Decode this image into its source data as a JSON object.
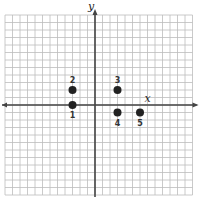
{
  "diagram": {
    "type": "coordinate-plane",
    "axes": {
      "x_label": "x",
      "y_label": "y"
    },
    "grid": {
      "x_min": -12,
      "x_max": 13,
      "y_min": -12,
      "y_max": 12,
      "cell_px": 7.5
    },
    "points": [
      {
        "label": "1",
        "x": -3,
        "y": 0,
        "label_pos": "below"
      },
      {
        "label": "2",
        "x": -3,
        "y": 2,
        "label_pos": "above"
      },
      {
        "label": "3",
        "x": 3,
        "y": 2,
        "label_pos": "above"
      },
      {
        "label": "4",
        "x": 3,
        "y": -1,
        "label_pos": "below"
      },
      {
        "label": "5",
        "x": 6,
        "y": -1,
        "label_pos": "below"
      }
    ],
    "colors": {
      "grid": "#bdbdbd",
      "axis": "#444444",
      "point": "#222222"
    }
  }
}
